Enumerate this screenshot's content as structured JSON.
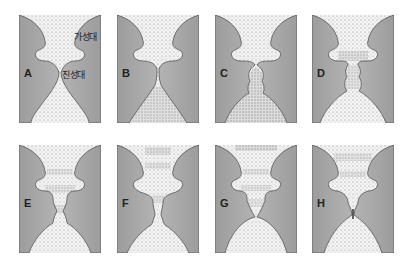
{
  "figure": {
    "colors": {
      "tissue": "#a9a9a9",
      "tissue_edge": "#555555",
      "airway": "#f2f2f2",
      "stipple": "#8c8c8c",
      "background": "#ffffff"
    },
    "annotations": {
      "false_vocal_fold": "가성대",
      "true_vocal_fold": "진성대"
    },
    "panels": [
      {
        "label": "A",
        "stage": "open, resting"
      },
      {
        "label": "B",
        "stage": "true folds approximating"
      },
      {
        "label": "C",
        "stage": "subglottal bulge"
      },
      {
        "label": "D",
        "stage": "air column pushing through"
      },
      {
        "label": "E",
        "stage": "glottis opening upward"
      },
      {
        "label": "F",
        "stage": "air release"
      },
      {
        "label": "G",
        "stage": "lower edges closing"
      },
      {
        "label": "H",
        "stage": "full closure"
      }
    ]
  }
}
